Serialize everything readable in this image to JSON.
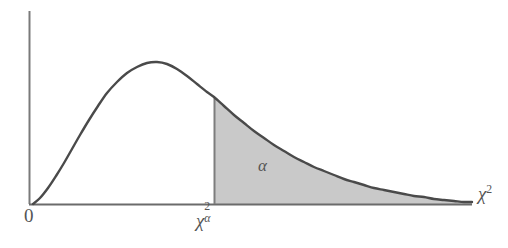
{
  "figure": {
    "kind": "chi-square-distribution-diagram",
    "background_color": "#ffffff",
    "curve_color": "#4a4a4a",
    "axis_color": "#6b6b6b",
    "shade_color": "#c9c9c9",
    "shade_edge_color": "#8a8a8a"
  },
  "labels": {
    "origin": "0",
    "critical_value_base": "χ",
    "critical_value_sup": "2",
    "critical_value_sub": "α",
    "x_axis_base": "χ",
    "x_axis_sup": "2",
    "area_label": "α"
  },
  "chart_data": {
    "type": "line",
    "title": "",
    "xlabel": "χ²",
    "ylabel": "",
    "grid": false,
    "legend": null,
    "axis_ranges": {
      "x_pixels": [
        33,
        472
      ],
      "y_pixels": [
        204,
        11
      ]
    },
    "annotations": [
      {
        "text": "0",
        "role": "origin-tick",
        "x_px": 30,
        "y_px": 215
      },
      {
        "text": "χ²ₐ",
        "role": "critical-value-tick",
        "x_px": 214,
        "y_px": 220
      },
      {
        "text": "χ²",
        "role": "x-axis-title",
        "x_px": 485,
        "y_px": 193
      },
      {
        "text": "α",
        "role": "shaded-area-label",
        "x_px": 264,
        "y_px": 166
      }
    ],
    "critical_value_x_px": 214,
    "curve_peak_px": {
      "x": 155,
      "y": 63
    },
    "shaded_region": {
      "from_x_px": 214,
      "to_x_px": 472,
      "label": "α",
      "fill": "#c9c9c9"
    },
    "series": [
      {
        "name": "chi-square density",
        "points_px": [
          [
            33,
            204
          ],
          [
            40,
            198
          ],
          [
            48,
            188
          ],
          [
            56,
            176
          ],
          [
            64,
            163
          ],
          [
            72,
            149
          ],
          [
            80,
            135
          ],
          [
            89,
            120
          ],
          [
            98,
            106
          ],
          [
            107,
            93
          ],
          [
            117,
            82
          ],
          [
            127,
            73
          ],
          [
            137,
            67
          ],
          [
            147,
            63
          ],
          [
            157,
            62
          ],
          [
            167,
            64
          ],
          [
            177,
            69
          ],
          [
            187,
            76
          ],
          [
            197,
            84
          ],
          [
            207,
            92
          ],
          [
            214,
            97
          ],
          [
            224,
            106
          ],
          [
            234,
            115
          ],
          [
            244,
            123
          ],
          [
            254,
            131
          ],
          [
            264,
            138
          ],
          [
            274,
            145
          ],
          [
            284,
            151
          ],
          [
            294,
            157
          ],
          [
            304,
            162
          ],
          [
            314,
            167
          ],
          [
            324,
            171
          ],
          [
            334,
            175
          ],
          [
            344,
            179
          ],
          [
            354,
            182
          ],
          [
            364,
            185
          ],
          [
            374,
            188
          ],
          [
            384,
            190
          ],
          [
            394,
            192
          ],
          [
            404,
            194
          ],
          [
            414,
            196
          ],
          [
            424,
            197
          ],
          [
            434,
            199
          ],
          [
            444,
            200
          ],
          [
            454,
            201
          ],
          [
            464,
            202
          ],
          [
            472,
            202
          ]
        ]
      }
    ]
  }
}
